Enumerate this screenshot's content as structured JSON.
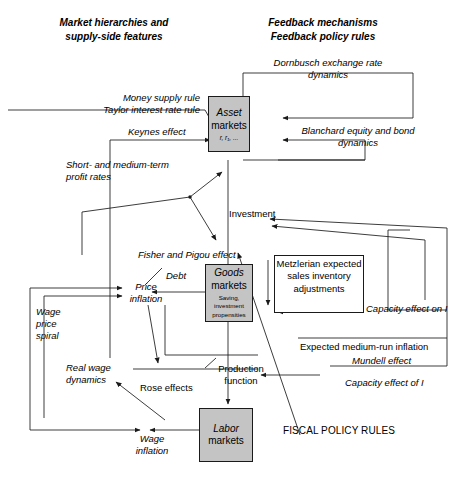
{
  "figure": {
    "type": "flow-diagram",
    "headers": {
      "left": "Market hierarchies and\nsupply-side features",
      "right": "Feedback mechanisms\nFeedback policy rules"
    },
    "nodes": [
      {
        "id": "asset-markets",
        "line1": "Asset",
        "line2": "markets",
        "sub": "r, r₁, ...",
        "shaded": true
      },
      {
        "id": "goods-markets",
        "line1": "Goods",
        "line2": "markets",
        "sub": "Saving,\ninvestment\npropensities",
        "shaded": true
      },
      {
        "id": "labor-markets",
        "line1": "Labor",
        "line2": "markets",
        "sub": "",
        "shaded": true
      }
    ],
    "feedback_boxes": [
      {
        "id": "dornbusch",
        "text": "Dornbusch exchange rate\ndynamics"
      },
      {
        "id": "blanchard",
        "text": "Blanchard equity and bond\ndynamics"
      },
      {
        "id": "metzlerian",
        "text": "Metzlerian\nexpected sales\ninventory\nadjustments"
      }
    ],
    "labels": [
      {
        "id": "money-supply-rule",
        "text": "Money supply rule",
        "italic": true
      },
      {
        "id": "taylor-interest-rate-rule",
        "text": "Taylor interest rate rule",
        "italic": true
      },
      {
        "id": "keynes-effect",
        "text": "Keynes effect",
        "italic": true
      },
      {
        "id": "short-medium-term-profit-rates",
        "text": "Short- and medium-term\nprofit rates",
        "italic": true
      },
      {
        "id": "investment",
        "text": "Investment",
        "italic": false
      },
      {
        "id": "fisher-pigou-effect",
        "text": "Fisher and Pigou effect",
        "italic": true
      },
      {
        "id": "debt",
        "text": "Debt",
        "italic": true
      },
      {
        "id": "price-inflation",
        "text": "Price\ninflation",
        "italic": true
      },
      {
        "id": "wage-price-spiral",
        "text": "Wage\nprice\nspiral",
        "italic": true
      },
      {
        "id": "real-wage-dynamics",
        "text": "Real wage\ndynamics",
        "italic": true
      },
      {
        "id": "rose-effects",
        "text": "Rose effects",
        "italic": false
      },
      {
        "id": "wage-inflation",
        "text": "Wage\ninflation",
        "italic": true
      },
      {
        "id": "production-function",
        "text": "Production\nfunction",
        "italic": false
      },
      {
        "id": "capacity-effect-on-i",
        "text": "Capacity effect on I",
        "italic": true
      },
      {
        "id": "expected-medium-run-inflation",
        "text": "Expected medium-run inflation",
        "italic": false
      },
      {
        "id": "mundell-effect",
        "text": "Mundell effect",
        "italic": true
      },
      {
        "id": "capacity-effect-of-i",
        "text": "Capacity effect of I",
        "italic": true
      },
      {
        "id": "fiscal-policy-rules",
        "text": "FISCAL POLICY RULES",
        "italic": false
      }
    ],
    "colors": {
      "node_fill": "#c4c4c4",
      "stroke": "#1a1a1a",
      "background": "#ffffff",
      "text": "#000000"
    }
  }
}
